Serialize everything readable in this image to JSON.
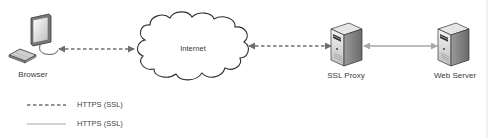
{
  "diagram": {
    "type": "network",
    "nodes": [
      {
        "id": "browser",
        "label": "Browser",
        "icon": "desktop-computer-icon"
      },
      {
        "id": "internet",
        "label": "Internet",
        "icon": "cloud-icon"
      },
      {
        "id": "ssl_proxy",
        "label": "SSL Proxy",
        "icon": "server-tower-icon"
      },
      {
        "id": "web_server",
        "label": "Web Server",
        "icon": "server-tower-icon"
      }
    ],
    "edges": [
      {
        "from": "browser",
        "to": "internet",
        "style": "dashed",
        "bidirectional": true
      },
      {
        "from": "internet",
        "to": "ssl_proxy",
        "style": "dashed",
        "bidirectional": true
      },
      {
        "from": "ssl_proxy",
        "to": "web_server",
        "style": "solid",
        "bidirectional": true
      }
    ],
    "legend": [
      {
        "style": "dashed",
        "label": "HTTPS (SSL)"
      },
      {
        "style": "solid",
        "label": "HTTPS (SSL)"
      }
    ],
    "colors": {
      "dashed_line": "#6e6e6e",
      "solid_line": "#a8a8a8",
      "outline": "#333333",
      "server_body": "#d9d9d9"
    }
  }
}
